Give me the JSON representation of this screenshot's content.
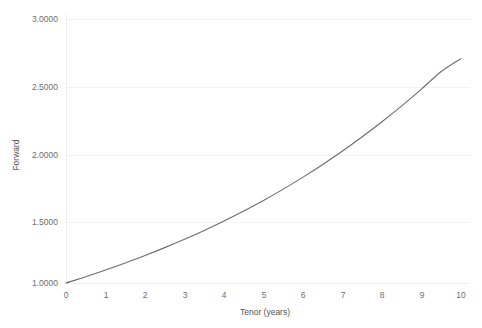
{
  "chart_data": {
    "type": "line",
    "title": "",
    "xlabel": "Tenor (years)",
    "ylabel": "Forward",
    "xlim": [
      0,
      10
    ],
    "ylim": [
      1.0,
      3.0
    ],
    "grid": true,
    "legend": false,
    "legend_position": "none",
    "line_color": "#6d6d6d",
    "grid_color": "#f2f2f2",
    "axis_color": "#ededed",
    "tick_label_color": "#6e6e6e",
    "x_ticks": [
      "0",
      "1",
      "2",
      "3",
      "4",
      "5",
      "6",
      "7",
      "8",
      "9",
      "10"
    ],
    "x_tick_values": [
      0,
      1,
      2,
      3,
      4,
      5,
      6,
      7,
      8,
      9,
      10
    ],
    "y_ticks": [
      "1.0000",
      "1.5000",
      "2.0000",
      "2.5000",
      "3.0000"
    ],
    "y_tick_values": [
      1.0,
      1.5,
      2.0,
      2.5,
      3.0
    ],
    "series": [
      {
        "name": "Forward",
        "x": [
          0,
          0.5,
          1,
          1.5,
          2,
          2.5,
          3,
          3.5,
          4,
          4.5,
          5,
          5.5,
          6,
          6.5,
          7,
          7.5,
          8,
          8.5,
          9,
          9.5,
          10
        ],
        "values": [
          1.0,
          1.048,
          1.099,
          1.152,
          1.208,
          1.268,
          1.331,
          1.398,
          1.469,
          1.545,
          1.625,
          1.711,
          1.802,
          1.898,
          2.0,
          2.108,
          2.222,
          2.342,
          2.469,
          2.602,
          2.7
        ]
      }
    ]
  }
}
